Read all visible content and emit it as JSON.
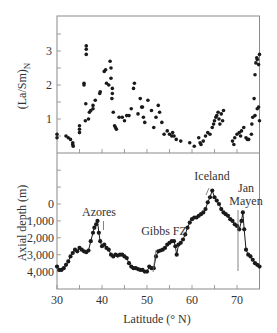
{
  "chart_data": [
    {
      "type": "scatter",
      "panel": "top",
      "title": "",
      "xlabel": "Latitude (° N)",
      "ylabel": "(La/Sm)N",
      "ylabel_main": "(La/Sm)",
      "ylabel_sub": "N",
      "xlim": [
        30,
        75
      ],
      "ylim": [
        0,
        4
      ],
      "yticks": [
        1,
        2,
        3
      ],
      "ytick_labels": [
        "1",
        "2",
        "3"
      ],
      "minor_yticks": [
        0.5,
        1.5,
        2.5,
        3.5
      ],
      "grid": false,
      "points": [
        [
          30,
          0.55
        ],
        [
          30,
          0.45
        ],
        [
          32,
          0.5
        ],
        [
          32.5,
          0.45
        ],
        [
          33,
          0.4
        ],
        [
          33.5,
          0.3
        ],
        [
          33.5,
          0.25
        ],
        [
          33.6,
          0.2
        ],
        [
          35,
          0.8
        ],
        [
          35,
          0.7
        ],
        [
          35,
          0.6
        ],
        [
          36,
          2.05
        ],
        [
          36,
          2.0
        ],
        [
          36.4,
          1.45
        ],
        [
          36.3,
          0.95
        ],
        [
          36.5,
          3.15
        ],
        [
          36.5,
          3.05
        ],
        [
          36.5,
          2.9
        ],
        [
          37,
          1.0
        ],
        [
          37.2,
          1.2
        ],
        [
          37.5,
          1.25
        ],
        [
          38,
          1.3
        ],
        [
          38,
          1.4
        ],
        [
          38.5,
          1.55
        ],
        [
          39.5,
          1.75
        ],
        [
          39.6,
          1.8
        ],
        [
          40.5,
          2.4
        ],
        [
          40.8,
          2.45
        ],
        [
          41,
          2.05
        ],
        [
          41.5,
          2.0
        ],
        [
          41.8,
          2.7
        ],
        [
          42,
          2.5
        ],
        [
          42,
          2.2
        ],
        [
          42.3,
          1.9
        ],
        [
          42.3,
          1.75
        ],
        [
          42.2,
          1.6
        ],
        [
          42.5,
          1.2
        ],
        [
          42.8,
          0.8
        ],
        [
          43,
          0.75
        ],
        [
          43.2,
          0.7
        ],
        [
          43.8,
          1.05
        ],
        [
          44.5,
          1.05
        ],
        [
          45,
          0.95
        ],
        [
          45.5,
          1.1
        ],
        [
          46,
          1.1
        ],
        [
          46.5,
          1.3
        ],
        [
          47,
          1.9
        ],
        [
          47.2,
          2.05
        ],
        [
          48,
          1.15
        ],
        [
          48.5,
          1.6
        ],
        [
          48.8,
          1.35
        ],
        [
          49,
          1.35
        ],
        [
          49.2,
          1.05
        ],
        [
          49.5,
          0.9
        ],
        [
          50.2,
          1.55
        ],
        [
          51,
          1.25
        ],
        [
          51.5,
          0.75
        ],
        [
          52,
          1.05
        ],
        [
          52.5,
          1.4
        ],
        [
          52.8,
          1.2
        ],
        [
          53.3,
          0.9
        ],
        [
          53.8,
          0.55
        ],
        [
          54.5,
          0.65
        ],
        [
          55,
          0.55
        ],
        [
          55.5,
          0.5
        ],
        [
          55.7,
          0.6
        ],
        [
          56,
          0.5
        ],
        [
          56.5,
          0.4
        ],
        [
          57.5,
          0.35
        ],
        [
          59.5,
          0.3
        ],
        [
          60.5,
          0.2
        ],
        [
          61.5,
          0.45
        ],
        [
          61.8,
          0.3
        ],
        [
          62,
          0.25
        ],
        [
          62.5,
          0.35
        ],
        [
          63,
          0.5
        ],
        [
          63.5,
          0.6
        ],
        [
          64,
          0.55
        ],
        [
          64.5,
          0.75
        ],
        [
          64.8,
          0.85
        ],
        [
          65,
          0.95
        ],
        [
          65.3,
          1.05
        ],
        [
          65.5,
          1.1
        ],
        [
          65.8,
          1.2
        ],
        [
          66,
          1.0
        ],
        [
          66.2,
          0.85
        ],
        [
          66.5,
          1.15
        ],
        [
          66.8,
          0.95
        ],
        [
          67,
          1.25
        ],
        [
          69,
          0.35
        ],
        [
          69.3,
          0.25
        ],
        [
          69.5,
          0.45
        ],
        [
          70,
          0.55
        ],
        [
          70.5,
          0.6
        ],
        [
          70.8,
          0.5
        ],
        [
          71,
          0.65
        ],
        [
          71.5,
          0.75
        ],
        [
          72,
          0.45
        ],
        [
          72.3,
          0.4
        ],
        [
          72.6,
          0.4
        ],
        [
          73.2,
          0.55
        ],
        [
          73.3,
          0.85
        ],
        [
          73.5,
          1.05
        ],
        [
          73.8,
          1.6
        ],
        [
          74,
          2.3
        ],
        [
          74.2,
          2.65
        ],
        [
          74.4,
          2.8
        ],
        [
          74.5,
          2.75
        ],
        [
          74.8,
          2.6
        ],
        [
          75,
          2.9
        ],
        [
          74,
          1.1
        ],
        [
          74.5,
          1.3
        ],
        [
          74.8,
          1.35
        ],
        [
          75,
          0.95
        ]
      ]
    },
    {
      "type": "line",
      "panel": "bottom",
      "title": "",
      "xlabel": "Latitude (° N)",
      "ylabel": "Axial depth (m)",
      "xlim": [
        30,
        75
      ],
      "ylim": [
        5000,
        -3000
      ],
      "inverted_y": true,
      "xticks": [
        30,
        40,
        50,
        60,
        70
      ],
      "xtick_labels": [
        "30",
        "40",
        "50",
        "60",
        "70"
      ],
      "minor_xticks": [
        35,
        45,
        55,
        65,
        75
      ],
      "yticks": [
        0,
        1000,
        2000,
        3000,
        4000
      ],
      "ytick_labels": [
        "0",
        "1,000",
        "2,000",
        "3,000",
        "4,000"
      ],
      "minor_yticks": [
        -1000,
        -2000
      ],
      "grid": false,
      "markers": true,
      "x": [
        30,
        30.5,
        31,
        31.5,
        32,
        32.5,
        33,
        33.5,
        34,
        34.5,
        35,
        35.5,
        36,
        36.5,
        37,
        37.5,
        38,
        38.3,
        38.7,
        39,
        39.3,
        39.6,
        40,
        40.5,
        41,
        41.5,
        42,
        42.5,
        43,
        43.5,
        44,
        44.5,
        45,
        45.5,
        46,
        46.5,
        47,
        47.5,
        48,
        48.5,
        49,
        49.5,
        50,
        50.5,
        51,
        51.5,
        52,
        52.5,
        53,
        53.5,
        54,
        54.5,
        55,
        55.5,
        56,
        56.3,
        56.6,
        57,
        57.5,
        58,
        58.5,
        59,
        59.5,
        60,
        60.5,
        61,
        61.5,
        62,
        62.5,
        63,
        63.5,
        64,
        64.5,
        65,
        65.5,
        66,
        66.5,
        67,
        67.5,
        68,
        68.5,
        69,
        69.5,
        70,
        70.5,
        71,
        71.3,
        71.6,
        72,
        72.5,
        73,
        73.5,
        74,
        74.5,
        75
      ],
      "y": [
        3700,
        3900,
        3900,
        3800,
        3600,
        3400,
        3100,
        2900,
        2700,
        2800,
        2600,
        2700,
        2800,
        2850,
        2750,
        2200,
        1700,
        1400,
        1200,
        1000,
        1700,
        2200,
        2500,
        2400,
        2600,
        2700,
        3000,
        3100,
        3000,
        3050,
        3000,
        3000,
        3100,
        3200,
        3500,
        3700,
        3800,
        3800,
        3850,
        3900,
        3900,
        4000,
        4000,
        3700,
        3800,
        3800,
        3100,
        2800,
        2750,
        2700,
        2600,
        2400,
        2300,
        2200,
        2200,
        2500,
        3000,
        2400,
        2300,
        2100,
        1800,
        1400,
        1100,
        900,
        800,
        800,
        700,
        600,
        500,
        300,
        -100,
        -400,
        -800,
        -400,
        -200,
        0,
        300,
        500,
        600,
        700,
        900,
        1000,
        1200,
        1300,
        1500,
        1000,
        500,
        1500,
        2700,
        3000,
        3100,
        3300,
        3500,
        3600,
        3700
      ]
    }
  ],
  "figure": {
    "upper_ylabel_main": "(La/Sm)",
    "upper_ylabel_sub": "N",
    "lower_ylabel": "Axial depth (m)",
    "xlabel": "Latitude (° N)",
    "x_tick_labels": [
      "30",
      "40",
      "50",
      "60",
      "70"
    ],
    "upper_y_tick_labels": [
      "1",
      "2",
      "3"
    ],
    "lower_y_tick_labels": [
      "0",
      "1,000",
      "2,000",
      "3,000",
      "4,000"
    ],
    "annotations": {
      "azores": "Azores",
      "gibbs": "Gibbs FZ",
      "iceland": "Iceland",
      "jan_mayen_1": "Jan",
      "jan_mayen_2": "Mayen"
    },
    "colors": {
      "ink": "#1a1a1a",
      "frame": "#888888",
      "leader": "#666666"
    }
  }
}
